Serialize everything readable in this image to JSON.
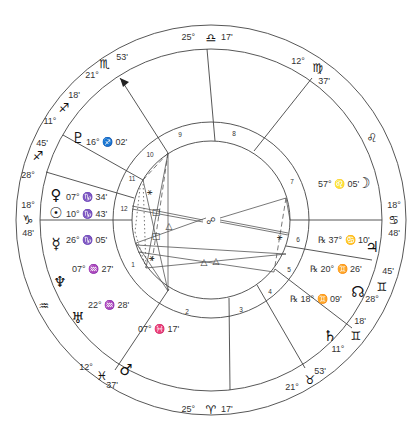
{
  "chart": {
    "center": [
      211,
      220
    ],
    "radii": {
      "outer": 195,
      "zodiac_inner": 171,
      "house_outer": 98,
      "house_inner": 79
    },
    "colors": {
      "line": "#444444",
      "text": "#333333",
      "glyph": "#111111"
    }
  },
  "zodiac_cusps": [
    {
      "id": "top",
      "deg": "25°",
      "sign": "♎",
      "sign_name": "libra",
      "min": "17'",
      "x": 211,
      "y": 38
    },
    {
      "id": "bottom",
      "deg": "25°",
      "sign": "♈",
      "sign_name": "aries",
      "min": "17'",
      "x": 211,
      "y": 410
    },
    {
      "id": "left",
      "deg": "18°",
      "sign": "♑",
      "sign_name": "capricorn",
      "min": "48'",
      "x": 28,
      "y": 220
    },
    {
      "id": "right",
      "deg": "18°",
      "sign": "♋",
      "sign_name": "cancer",
      "min": "48'",
      "x": 394,
      "y": 220
    }
  ],
  "sign_labels": [
    {
      "sign": "♏",
      "sign_name": "scorpio",
      "x": 105,
      "y": 64,
      "deg": "21°",
      "dx": 92,
      "dy": 76,
      "min": "53'",
      "mx": 122,
      "my": 58
    },
    {
      "sign": "♐",
      "sign_name": "sagittarius",
      "x": 64,
      "y": 108,
      "deg": "11°",
      "dx": 50,
      "dy": 122,
      "min": "18'",
      "mx": 74,
      "my": 96
    },
    {
      "sign": "♐",
      "sign_name": "sagittarius-2",
      "x": 38,
      "y": 156,
      "deg": "28°",
      "dx": 28,
      "dy": 176,
      "min": "45'",
      "mx": 42,
      "my": 144
    },
    {
      "sign": "♍",
      "sign_name": "virgo",
      "x": 318,
      "y": 68,
      "deg": "12°",
      "dx": 298,
      "dy": 62,
      "min": "37'",
      "mx": 324,
      "my": 82
    },
    {
      "sign": "♌",
      "sign_name": "leo",
      "x": 372,
      "y": 138,
      "deg": "",
      "dx": 0,
      "dy": 0,
      "min": "",
      "mx": 0,
      "my": 0
    },
    {
      "sign": "♒",
      "sign_name": "aquarius",
      "x": 44,
      "y": 306,
      "deg": "",
      "dx": 0,
      "dy": 0,
      "min": "",
      "mx": 0,
      "my": 0
    },
    {
      "sign": "♓",
      "sign_name": "pisces",
      "x": 102,
      "y": 376,
      "deg": "12°",
      "dx": 86,
      "dy": 368,
      "min": "37'",
      "mx": 112,
      "my": 386
    },
    {
      "sign": "♉",
      "sign_name": "taurus",
      "x": 310,
      "y": 380,
      "deg": "21°",
      "dx": 292,
      "dy": 388,
      "min": "53'",
      "mx": 320,
      "my": 372
    },
    {
      "sign": "♊",
      "sign_name": "gemini",
      "x": 356,
      "y": 336,
      "deg": "11°",
      "dx": 338,
      "dy": 350,
      "min": "18'",
      "mx": 360,
      "my": 322
    },
    {
      "sign": "♊",
      "sign_name": "gemini-2",
      "x": 382,
      "y": 287,
      "deg": "28°",
      "dx": 372,
      "dy": 300,
      "min": "45'",
      "mx": 388,
      "my": 272
    }
  ],
  "house_cusps": [
    {
      "house": 1,
      "x1": 132,
      "y1": 220,
      "x2": 40,
      "y2": 220
    },
    {
      "house": 2,
      "x1": 169,
      "y1": 289,
      "x2": 115,
      "y2": 370
    },
    {
      "house": 3,
      "x1": 229,
      "y1": 298,
      "x2": 230,
      "y2": 390
    },
    {
      "house": 4,
      "x1": 257,
      "y1": 285,
      "x2": 305,
      "y2": 368
    },
    {
      "house": 5,
      "x1": 275,
      "y1": 269,
      "x2": 352,
      "y2": 328
    },
    {
      "house": 6,
      "x1": 286,
      "y1": 246,
      "x2": 372,
      "y2": 260
    },
    {
      "house": 7,
      "x1": 290,
      "y1": 220,
      "x2": 382,
      "y2": 220
    },
    {
      "house": 8,
      "x1": 254,
      "y1": 151,
      "x2": 312,
      "y2": 78
    },
    {
      "house": 9,
      "x1": 215,
      "y1": 141,
      "x2": 207,
      "y2": 49
    },
    {
      "house": 10,
      "x1": 168,
      "y1": 153,
      "x2": 120,
      "y2": 78
    },
    {
      "house": 11,
      "x1": 143,
      "y1": 180,
      "x2": 63,
      "y2": 135
    },
    {
      "house": 12,
      "x1": 134,
      "y1": 198,
      "x2": 46,
      "y2": 172
    }
  ],
  "house_numbers": [
    {
      "n": "1",
      "x": 133,
      "y": 265
    },
    {
      "n": "2",
      "x": 187,
      "y": 312
    },
    {
      "n": "3",
      "x": 241,
      "y": 310
    },
    {
      "n": "4",
      "x": 270,
      "y": 292
    },
    {
      "n": "5",
      "x": 289,
      "y": 270
    },
    {
      "n": "6",
      "x": 298,
      "y": 240
    },
    {
      "n": "7",
      "x": 292,
      "y": 182
    },
    {
      "n": "8",
      "x": 234,
      "y": 134
    },
    {
      "n": "9",
      "x": 180,
      "y": 135
    },
    {
      "n": "10",
      "x": 150,
      "y": 155
    },
    {
      "n": "11",
      "x": 132,
      "y": 179
    },
    {
      "n": "12",
      "x": 124,
      "y": 209
    }
  ],
  "planets": [
    {
      "name": "pluto",
      "glyph": "♇",
      "x": 78,
      "y": 138,
      "text": "16° ♐ 02'",
      "tx": 86,
      "ty": 143,
      "retro": ""
    },
    {
      "name": "venus",
      "glyph": "♀",
      "x": 56,
      "y": 195,
      "text": "07° ♑ 34'",
      "tx": 66,
      "ty": 198,
      "retro": ""
    },
    {
      "name": "sun",
      "glyph": "☉",
      "x": 56,
      "y": 213,
      "text": "10° ♑ 43'",
      "tx": 66,
      "ty": 215,
      "retro": ""
    },
    {
      "name": "mercury",
      "glyph": "☿",
      "x": 56,
      "y": 244,
      "text": "26° ♑ 05'",
      "tx": 66,
      "ty": 241,
      "retro": ""
    },
    {
      "name": "neptune",
      "glyph": "♆",
      "x": 60,
      "y": 282,
      "text": "07° ♒ 27'",
      "tx": 72,
      "ty": 270,
      "retro": ""
    },
    {
      "name": "uranus",
      "glyph": "♅",
      "x": 78,
      "y": 318,
      "text": "22° ♒ 28'",
      "tx": 88,
      "ty": 306,
      "retro": ""
    },
    {
      "name": "mars",
      "glyph": "♂",
      "x": 126,
      "y": 370,
      "text": "07° ♓ 17'",
      "tx": 138,
      "ty": 330,
      "retro": ""
    },
    {
      "name": "moon",
      "glyph": "☽",
      "x": 364,
      "y": 183,
      "text": "57° ♌ 05'",
      "tx": 318,
      "ty": 185,
      "retro": ""
    },
    {
      "name": "jupiter",
      "glyph": "♃",
      "x": 372,
      "y": 247,
      "text": "37° ♋ 10'",
      "tx": 318,
      "ty": 241,
      "retro": "℞"
    },
    {
      "name": "north-node",
      "glyph": "☊",
      "x": 358,
      "y": 292,
      "text": "20° ♊ 26'",
      "tx": 310,
      "ty": 270,
      "retro": "℞"
    },
    {
      "name": "saturn",
      "glyph": "♄",
      "x": 330,
      "y": 336,
      "text": "18° ♊ 09'",
      "tx": 290,
      "ty": 300,
      "retro": "℞"
    }
  ],
  "aspects": [
    {
      "x1": 168,
      "y1": 153,
      "x2": 168,
      "y2": 291,
      "style": "solid"
    },
    {
      "x1": 168,
      "y1": 153,
      "x2": 143,
      "y2": 180,
      "style": "dash"
    },
    {
      "x1": 168,
      "y1": 153,
      "x2": 146,
      "y2": 268,
      "style": "solid"
    },
    {
      "x1": 168,
      "y1": 153,
      "x2": 152,
      "y2": 262,
      "style": "dash"
    },
    {
      "x1": 143,
      "y1": 180,
      "x2": 146,
      "y2": 268,
      "style": "dot"
    },
    {
      "x1": 143,
      "y1": 180,
      "x2": 168,
      "y2": 291,
      "style": "solid"
    },
    {
      "x1": 132,
      "y1": 206,
      "x2": 203,
      "y2": 220,
      "style": "solid"
    },
    {
      "x1": 132,
      "y1": 209,
      "x2": 203,
      "y2": 222,
      "style": "solid"
    },
    {
      "x1": 220,
      "y1": 220,
      "x2": 288,
      "y2": 233,
      "style": "solid"
    },
    {
      "x1": 220,
      "y1": 222,
      "x2": 288,
      "y2": 235,
      "style": "solid"
    },
    {
      "x1": 220,
      "y1": 218,
      "x2": 286,
      "y2": 198,
      "style": "solid"
    },
    {
      "x1": 286,
      "y1": 198,
      "x2": 274,
      "y2": 272,
      "style": "dash"
    },
    {
      "x1": 286,
      "y1": 198,
      "x2": 290,
      "y2": 220,
      "style": "solid"
    },
    {
      "x1": 136,
      "y1": 243,
      "x2": 206,
      "y2": 218,
      "style": "solid"
    },
    {
      "x1": 136,
      "y1": 245,
      "x2": 286,
      "y2": 254,
      "style": "solid"
    },
    {
      "x1": 146,
      "y1": 268,
      "x2": 286,
      "y2": 254,
      "style": "solid"
    },
    {
      "x1": 138,
      "y1": 252,
      "x2": 274,
      "y2": 272,
      "style": "solid"
    },
    {
      "x1": 168,
      "y1": 291,
      "x2": 136,
      "y2": 243,
      "style": "solid"
    },
    {
      "x1": 135,
      "y1": 232,
      "x2": 146,
      "y2": 268,
      "style": "dot"
    },
    {
      "x1": 140,
      "y1": 188,
      "x2": 135,
      "y2": 232,
      "style": "dot"
    }
  ],
  "aspect_symbols": [
    {
      "sym": "⚹",
      "name": "sextile",
      "x": 149,
      "y": 192
    },
    {
      "sym": "□",
      "name": "square",
      "x": 156,
      "y": 212
    },
    {
      "sym": "△",
      "name": "trine",
      "x": 169,
      "y": 226
    },
    {
      "sym": "□",
      "name": "square",
      "x": 156,
      "y": 236
    },
    {
      "sym": "⚹",
      "name": "sextile",
      "x": 151,
      "y": 258
    },
    {
      "sym": "☍",
      "name": "opposition",
      "x": 211,
      "y": 221
    },
    {
      "sym": "⚹",
      "name": "sextile",
      "x": 279,
      "y": 237
    },
    {
      "sym": "△",
      "name": "trine",
      "x": 204,
      "y": 262
    },
    {
      "sym": "△",
      "name": "trine",
      "x": 216,
      "y": 261
    }
  ],
  "mc_arrow": {
    "x": 120,
    "y": 78
  }
}
